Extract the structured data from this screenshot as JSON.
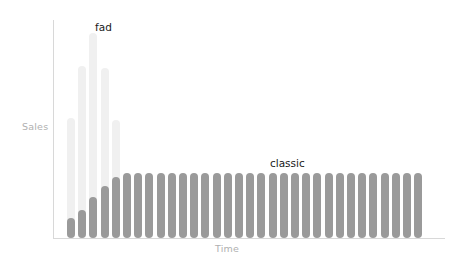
{
  "chart_data": {
    "type": "bar",
    "title": "",
    "subtitle": "",
    "xlabel": "Time",
    "ylabel": "Sales",
    "grid": false,
    "legend_position": "inline-annotation",
    "x_axis_ticks": [],
    "y_axis_ticks": [],
    "ylim": [
      0,
      100
    ],
    "xlim": [
      0,
      32
    ],
    "annotations": [
      {
        "text": "fad",
        "x_index": 2,
        "color": "#1a1a1a"
      },
      {
        "text": "classic",
        "x_index": 21,
        "color": "#1a1a1a"
      }
    ],
    "series": [
      {
        "name": "fad",
        "color": "#f0f0f0",
        "values": [
          55,
          79,
          94,
          78,
          54
        ]
      },
      {
        "name": "classic",
        "color": "#9a9a9a",
        "values": [
          9,
          13,
          19,
          24,
          28,
          30,
          30,
          30,
          30,
          30,
          30,
          30,
          30,
          30,
          30,
          30,
          30,
          30,
          30,
          30,
          30,
          30,
          30,
          30,
          30,
          30,
          30,
          30,
          30,
          30,
          30,
          30
        ]
      }
    ]
  },
  "axes": {
    "y_title": "Sales",
    "x_title": "Time",
    "axis_color": "#d8d8d8",
    "title_color": "#b0b0b0"
  },
  "labels": {
    "fad": "fad",
    "classic": "classic"
  }
}
